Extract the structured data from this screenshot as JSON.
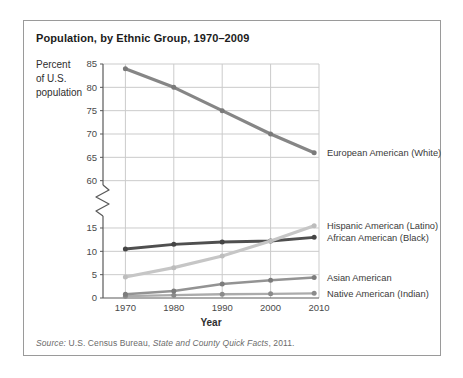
{
  "figure": {
    "title": "Population, by Ethnic Group, 1970–2009",
    "y_axis_label_lines": [
      "Percent",
      "of U.S.",
      "population"
    ],
    "source": {
      "prefix_italic": "Source:",
      "mid": " U.S. Census Bureau, ",
      "work_italic": "State and County Quick Facts",
      "suffix": ", 2011."
    }
  },
  "chart_data": {
    "type": "line",
    "title": "Population, by Ethnic Group, 1970–2009",
    "xlabel": "Year",
    "ylabel": "Percent of U.S. population",
    "x": [
      1970,
      1980,
      1990,
      2000,
      2009
    ],
    "x_ticks": [
      1970,
      1980,
      1990,
      2000,
      2010
    ],
    "y_ticks_upper": [
      85,
      80,
      75,
      70,
      65,
      60
    ],
    "y_ticks_lower": [
      15,
      10,
      5,
      0
    ],
    "axis_break": true,
    "x_range": [
      1965,
      2010
    ],
    "legend_position": "right-of-line-ends",
    "grid": true,
    "series": [
      {
        "name": "European American (White)",
        "values": [
          84,
          80,
          75,
          70,
          66
        ],
        "color": "#868686",
        "marker_color": "#7a7a7a",
        "stroke_width": 3.2
      },
      {
        "name": "African American (Black)",
        "values": [
          10.5,
          11.5,
          12,
          12.2,
          13
        ],
        "color": "#4f4f4f",
        "marker_color": "#454545",
        "stroke_width": 2.9
      },
      {
        "name": "Native American (Indian)",
        "values": [
          0.4,
          0.6,
          0.8,
          0.9,
          1
        ],
        "color": "#ababab",
        "marker_color": "#8a8a8a",
        "stroke_width": 2.3
      },
      {
        "name": "Asian American",
        "values": [
          0.8,
          1.5,
          3,
          3.8,
          4.4
        ],
        "color": "#939393",
        "marker_color": "#7c7c7c",
        "stroke_width": 2.5
      },
      {
        "name": "Hispanic American (Latino)",
        "values": [
          4.5,
          6.5,
          9,
          12.2,
          15.5
        ],
        "color": "#c6c6c6",
        "marker_color": "#bdbdbd",
        "stroke_width": 3.2
      }
    ],
    "colors": {
      "gridline": "#cbcbcb",
      "axis": "#5a5a5a",
      "tick_label": "#4a4a4a",
      "legend_text": "#3a3a3a",
      "border": "#9a9a9a"
    }
  }
}
